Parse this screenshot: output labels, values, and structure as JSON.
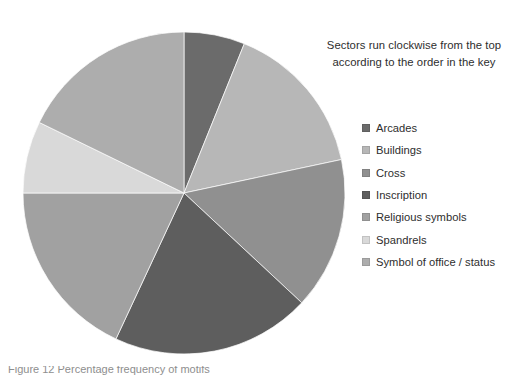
{
  "chart_data": {
    "type": "pie",
    "title": "",
    "note": {
      "lines": [
        "Sectors run clockwise from the top",
        "according to the order in the key"
      ]
    },
    "legend_position": "right",
    "direction": "clockwise",
    "start_angle_deg": 0,
    "center": {
      "x": 184,
      "y": 193
    },
    "radius": 161,
    "categories": [
      "Arcades",
      "Buildings",
      "Cross",
      "Inscription",
      "Religious symbols",
      "Spandrels",
      "Symbol of office / status"
    ],
    "values": [
      6.1,
      15.6,
      15.3,
      20.0,
      18.1,
      7.2,
      17.7
    ],
    "angles_deg": [
      22,
      56,
      55,
      72,
      65,
      26,
      64
    ],
    "colors": [
      "#6b6b6b",
      "#b7b7b7",
      "#909090",
      "#5e5e5e",
      "#a1a1a1",
      "#d9d9d9",
      "#adadad"
    ],
    "slices": [
      {
        "label": "Arcades",
        "value": 6.1,
        "angle_deg": 22,
        "start_deg": 0,
        "end_deg": 22,
        "color": "#6b6b6b"
      },
      {
        "label": "Buildings",
        "value": 15.6,
        "angle_deg": 56,
        "start_deg": 22,
        "end_deg": 78,
        "color": "#b7b7b7"
      },
      {
        "label": "Cross",
        "value": 15.3,
        "angle_deg": 55,
        "start_deg": 78,
        "end_deg": 133,
        "color": "#909090"
      },
      {
        "label": "Inscription",
        "value": 20.0,
        "angle_deg": 72,
        "start_deg": 133,
        "end_deg": 205,
        "color": "#5e5e5e"
      },
      {
        "label": "Religious symbols",
        "value": 18.1,
        "angle_deg": 65,
        "start_deg": 205,
        "end_deg": 270,
        "color": "#a1a1a1"
      },
      {
        "label": "Spandrels",
        "value": 7.2,
        "angle_deg": 26,
        "start_deg": 270,
        "end_deg": 296,
        "color": "#d9d9d9"
      },
      {
        "label": "Symbol of office / status",
        "value": 17.7,
        "angle_deg": 64,
        "start_deg": 296,
        "end_deg": 360,
        "color": "#adadad"
      }
    ]
  },
  "caption": {
    "text": "Figure 12  Percentage frequency of motifs"
  }
}
